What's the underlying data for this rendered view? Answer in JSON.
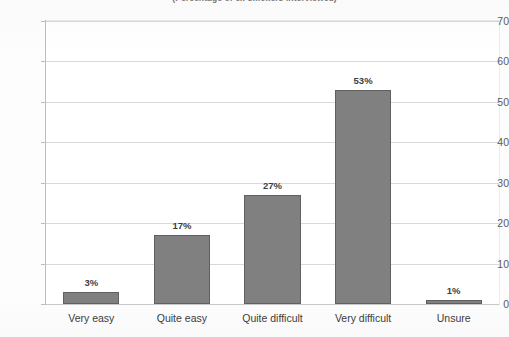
{
  "chart_data": {
    "type": "bar",
    "title": "(Percentage of ex-smokers interviewed)",
    "categories": [
      "Very easy",
      "Quite easy",
      "Quite difficult",
      "Very difficult",
      "Unsure"
    ],
    "values": [
      3,
      17,
      27,
      53,
      1
    ],
    "data_labels": [
      "3%",
      "17%",
      "27%",
      "53%",
      "1%"
    ],
    "xlabel": "",
    "ylabel": "",
    "ylim": [
      0,
      70
    ],
    "ytick_step": 10,
    "yticks": [
      0,
      10,
      20,
      30,
      40,
      50,
      60,
      70
    ],
    "ytick_labels": [
      "0",
      "10",
      "20",
      "30",
      "40",
      "50",
      "60",
      "70"
    ],
    "grid": true,
    "grid_axis": "y",
    "legend": false,
    "legend_position": "none",
    "series_color": "#808080",
    "series_border_color": "#606060",
    "gridline_color": "#d9d9d9",
    "axis_color": "#bdbdbd",
    "plot_border_color": "#e3e3e3",
    "label_text_color": "#3c3c3c",
    "value_text_color": "#3e3e3e",
    "background_color": "#ffffff"
  }
}
